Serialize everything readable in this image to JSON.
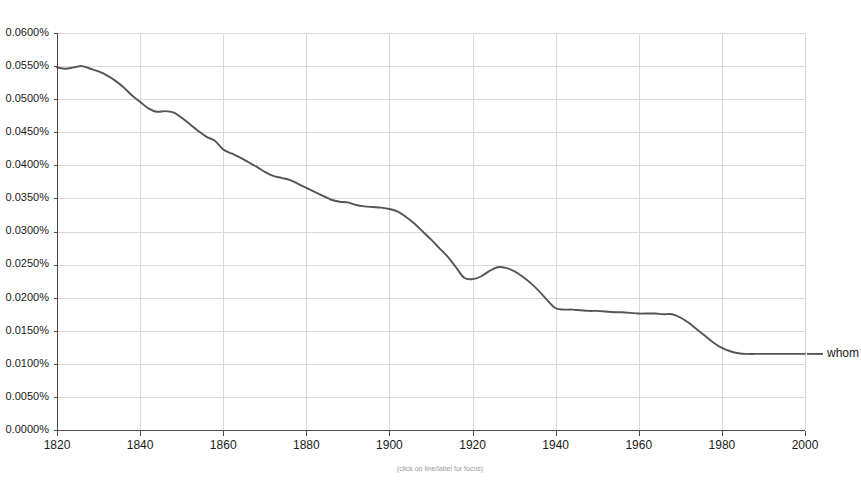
{
  "chart_data": {
    "type": "line",
    "title": "",
    "xlabel": "",
    "ylabel": "",
    "caption": "(click on line/label for focus)",
    "xlim": [
      1820,
      2000
    ],
    "ylim": [
      0.0,
      0.06
    ],
    "grid": true,
    "legend_position": "right",
    "y_tick_labels": [
      "0.0600%",
      "0.0550%",
      "0.0500%",
      "0.0450%",
      "0.0400%",
      "0.0350%",
      "0.0300%",
      "0.0250%",
      "0.0200%",
      "0.0150%",
      "0.0100%",
      "0.0050%",
      "0.0000%"
    ],
    "y_tick_values": [
      0.06,
      0.055,
      0.05,
      0.045,
      0.04,
      0.035,
      0.03,
      0.025,
      0.02,
      0.015,
      0.01,
      0.005,
      0.0
    ],
    "x_tick_labels": [
      "1820",
      "1840",
      "1860",
      "1880",
      "1900",
      "1920",
      "1940",
      "1960",
      "1980",
      "2000"
    ],
    "x_tick_values": [
      1820,
      1840,
      1860,
      1880,
      1900,
      1920,
      1940,
      1960,
      1980,
      2000
    ],
    "series": [
      {
        "name": "whom",
        "color": "#555555",
        "x": [
          1820,
          1822,
          1824,
          1826,
          1828,
          1830,
          1832,
          1834,
          1836,
          1838,
          1840,
          1842,
          1844,
          1846,
          1848,
          1850,
          1852,
          1854,
          1856,
          1858,
          1860,
          1862,
          1864,
          1866,
          1868,
          1870,
          1872,
          1874,
          1876,
          1878,
          1880,
          1882,
          1884,
          1886,
          1888,
          1890,
          1892,
          1894,
          1896,
          1898,
          1900,
          1902,
          1904,
          1906,
          1908,
          1910,
          1912,
          1914,
          1916,
          1918,
          1920,
          1922,
          1924,
          1926,
          1928,
          1930,
          1932,
          1934,
          1936,
          1938,
          1940,
          1942,
          1944,
          1946,
          1948,
          1950,
          1952,
          1954,
          1956,
          1958,
          1960,
          1962,
          1964,
          1966,
          1968,
          1970,
          1972,
          1974,
          1976,
          1978,
          1980,
          1982,
          1984,
          1986,
          1988,
          1990,
          1992,
          1994,
          1996,
          1998,
          2000
        ],
        "values": [
          0.0548,
          0.0546,
          0.0548,
          0.055,
          0.0546,
          0.0542,
          0.0536,
          0.0528,
          0.0518,
          0.0506,
          0.0496,
          0.0486,
          0.0481,
          0.0482,
          0.048,
          0.0472,
          0.0462,
          0.0452,
          0.0443,
          0.0437,
          0.0424,
          0.0418,
          0.0412,
          0.0405,
          0.0398,
          0.039,
          0.0384,
          0.0381,
          0.0378,
          0.0372,
          0.0366,
          0.036,
          0.0354,
          0.0348,
          0.0345,
          0.0344,
          0.034,
          0.0338,
          0.0337,
          0.0336,
          0.0334,
          0.033,
          0.0322,
          0.0312,
          0.03,
          0.0288,
          0.0275,
          0.0262,
          0.0246,
          0.023,
          0.0228,
          0.0232,
          0.024,
          0.0246,
          0.0245,
          0.024,
          0.0232,
          0.0222,
          0.021,
          0.0196,
          0.0184,
          0.0182,
          0.0182,
          0.0181,
          0.018,
          0.018,
          0.0179,
          0.0178,
          0.0178,
          0.0177,
          0.0176,
          0.0176,
          0.0176,
          0.0175,
          0.0175,
          0.017,
          0.0162,
          0.0152,
          0.0142,
          0.0132,
          0.0124,
          0.0119,
          0.0116,
          0.0115,
          0.0115,
          0.0115,
          0.0115,
          0.0115,
          0.0115,
          0.0115,
          0.0115
        ]
      }
    ]
  },
  "colors": {
    "series": "#555555",
    "gridline": "#d9d9d9",
    "axis": "#4a4a4a",
    "background": "#ffffff",
    "text": "#1a1a1a",
    "caption": "#9a9a9a"
  }
}
